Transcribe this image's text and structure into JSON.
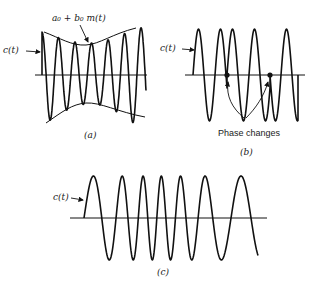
{
  "panels": {
    "a": {
      "caption": "(a)",
      "signal_label": "c(t)",
      "envelope_label": "a₀ + b₀ m(t)",
      "description": "Amplitude modulation"
    },
    "b": {
      "caption": "(b)",
      "signal_label": "c(t)",
      "annotation": "Phase changes",
      "description": "Phase modulation"
    },
    "c": {
      "caption": "(c)",
      "signal_label": "c(t)",
      "description": "Frequency modulation"
    }
  },
  "colors": {
    "stroke": "#111111",
    "background": "#ffffff"
  }
}
